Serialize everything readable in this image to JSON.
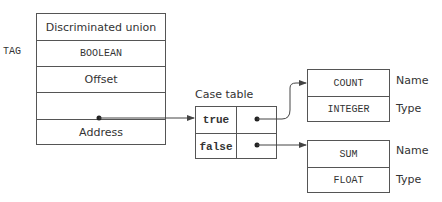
{
  "union": {
    "side_label": "TAG",
    "rows": [
      {
        "text": "Discriminated union",
        "style": "sans"
      },
      {
        "text": "BOOLEAN",
        "style": "mono"
      },
      {
        "text": "Offset",
        "style": "sans"
      },
      {
        "text": "",
        "style": "pointer"
      },
      {
        "text": "Address",
        "style": "sans"
      }
    ]
  },
  "case_table": {
    "title": "Case table",
    "rows": [
      {
        "key": "true"
      },
      {
        "key": "false"
      }
    ]
  },
  "variants": [
    {
      "name_value": "COUNT",
      "type_value": "INTEGER",
      "name_label": "Name",
      "type_label": "Type"
    },
    {
      "name_value": "SUM",
      "type_value": "FLOAT",
      "name_label": "Name",
      "type_label": "Type"
    }
  ],
  "colors": {
    "line": "#555555",
    "text": "#333333"
  }
}
